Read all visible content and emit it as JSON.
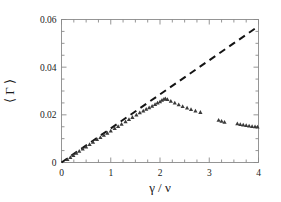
{
  "chart_data": {
    "type": "scatter",
    "title": "",
    "subtitle": "",
    "xlabel": "γ / ν",
    "ylabel": "⟨ Γ ⟩",
    "xlim": [
      0,
      4
    ],
    "ylim": [
      0,
      0.06
    ],
    "x_ticks": [
      0,
      1,
      2,
      3,
      4
    ],
    "x_tick_labels": [
      "0",
      "1",
      "2",
      "3",
      "4"
    ],
    "x_minor_ticks": [
      0.25,
      0.5,
      0.75,
      1.25,
      1.5,
      1.75,
      2.25,
      2.5,
      2.75,
      3.25,
      3.5,
      3.75
    ],
    "y_ticks": [
      0,
      0.02,
      0.04,
      0.06
    ],
    "y_tick_labels": [
      "0",
      "0.02",
      "0.04",
      "0.06"
    ],
    "y_minor_ticks": [
      0.005,
      0.01,
      0.015,
      0.025,
      0.03,
      0.035,
      0.045,
      0.05,
      0.055
    ],
    "grid": false,
    "legend": null,
    "legend_position": "none",
    "marker_color": "#3a3a3a",
    "line_color": "#141414",
    "frame_color": "#8a8a8a",
    "series": [
      {
        "name": "data",
        "type": "scatter",
        "marker": "triangle",
        "points": [
          [
            0.12,
            0.0013
          ],
          [
            0.18,
            0.0022
          ],
          [
            0.24,
            0.003
          ],
          [
            0.3,
            0.004
          ],
          [
            0.36,
            0.0048
          ],
          [
            0.43,
            0.0057
          ],
          [
            0.5,
            0.0066
          ],
          [
            0.57,
            0.0076
          ],
          [
            0.64,
            0.0086
          ],
          [
            0.72,
            0.0097
          ],
          [
            0.79,
            0.0106
          ],
          [
            0.86,
            0.0115
          ],
          [
            0.93,
            0.0124
          ],
          [
            1.0,
            0.0133
          ],
          [
            1.08,
            0.0143
          ],
          [
            1.15,
            0.0152
          ],
          [
            1.22,
            0.0161
          ],
          [
            1.3,
            0.0172
          ],
          [
            1.37,
            0.0181
          ],
          [
            1.44,
            0.019
          ],
          [
            1.52,
            0.02
          ],
          [
            1.59,
            0.0209
          ],
          [
            1.66,
            0.0217
          ],
          [
            1.72,
            0.0224
          ],
          [
            1.78,
            0.023
          ],
          [
            1.84,
            0.0237
          ],
          [
            1.9,
            0.0244
          ],
          [
            1.95,
            0.025
          ],
          [
            2.0,
            0.0256
          ],
          [
            2.04,
            0.0262
          ],
          [
            2.08,
            0.0266
          ],
          [
            2.11,
            0.0268
          ],
          [
            2.15,
            0.0265
          ],
          [
            2.22,
            0.0258
          ],
          [
            2.3,
            0.025
          ],
          [
            2.38,
            0.0243
          ],
          [
            2.46,
            0.0236
          ],
          [
            2.55,
            0.0229
          ],
          [
            2.63,
            0.0223
          ],
          [
            2.72,
            0.0217
          ],
          [
            2.82,
            0.0211
          ],
          [
            3.19,
            0.0178
          ],
          [
            3.25,
            0.0174
          ],
          [
            3.31,
            0.017
          ],
          [
            3.57,
            0.0163
          ],
          [
            3.63,
            0.016
          ],
          [
            3.69,
            0.0158
          ],
          [
            3.75,
            0.0156
          ],
          [
            3.81,
            0.0154
          ],
          [
            3.87,
            0.0152
          ],
          [
            3.93,
            0.0151
          ],
          [
            3.98,
            0.015
          ]
        ]
      },
      {
        "name": "linear-reference",
        "type": "line",
        "style": "dashed",
        "x": [
          0,
          4
        ],
        "y": [
          0,
          0.0572
        ]
      }
    ]
  }
}
